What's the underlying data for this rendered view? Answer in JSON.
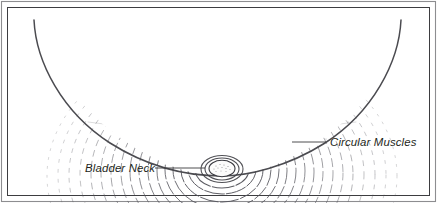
{
  "figure": {
    "medium": "pen-and-ink anatomical line illustration",
    "background_color": "#ffffff",
    "ink_color": "#3a3a40",
    "frame": {
      "present": true,
      "style": "thin double rectangular border",
      "outer_color": "#8d8d90",
      "inner_color": "#3d3d40"
    }
  },
  "labels": [
    {
      "id": "bladder-neck",
      "text": "Bladder Neck",
      "style": "italic",
      "color": "#231f20",
      "x": 85,
      "y": 172,
      "leader": {
        "x1": 155,
        "y1": 168,
        "x2": 205,
        "y2": 168
      }
    },
    {
      "id": "circular-muscles",
      "text": "Circular Muscles",
      "style": "italic",
      "color": "#231f20",
      "x": 330,
      "y": 146,
      "leader": {
        "x1": 292,
        "y1": 142,
        "x2": 326,
        "y2": 142
      }
    }
  ],
  "anatomy": {
    "funnel": {
      "description": "Parabolic funnel of the bladder base converging to the bladder neck orifice",
      "apex_x": 222,
      "apex_y": 175,
      "left_rim_x": 34,
      "right_rim_x": 401,
      "rim_y": 20
    },
    "circular_muscles": {
      "description": "Concentric dashed and stippled rings representing circular smooth muscle fibers",
      "ring_count": 17,
      "render": "broken dashed ellipses fading toward the periphery"
    },
    "orifice": {
      "description": "Small stippled oval opening at the apex — the bladder neck lumen",
      "cx": 222,
      "cy": 168,
      "rx": 13,
      "ry": 8
    }
  },
  "chart_data": {
    "type": "diagram",
    "annotations": [
      "Bladder Neck",
      "Circular Muscles"
    ]
  }
}
